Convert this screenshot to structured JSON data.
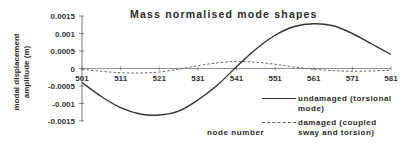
{
  "chart_data": {
    "type": "line",
    "title": "Mass normalised mode shapes",
    "xlabel": "node number",
    "ylabel": "modal displacement amplitude (m)",
    "xlim": [
      501,
      581
    ],
    "ylim": [
      -0.0015,
      0.0015
    ],
    "x_ticks": [
      501,
      511,
      521,
      531,
      541,
      551,
      561,
      571,
      581
    ],
    "y_ticks": [
      0.0015,
      0.001,
      0.0005,
      0,
      -0.0005,
      -0.001,
      -0.0015
    ],
    "y_tick_labels": [
      "0.0015",
      "0.001",
      "0.0005",
      "0",
      "-0.0005",
      "-0.001",
      "-0.0015"
    ],
    "grid": false,
    "legend_position": "lower right (outside plot area)",
    "x": [
      501,
      506,
      511,
      516,
      521,
      526,
      531,
      536,
      541,
      546,
      551,
      556,
      561,
      566,
      571,
      576,
      581
    ],
    "series": [
      {
        "name": "undamaged (torsional mode)",
        "style": "solid",
        "color": "#333333",
        "values": [
          -0.0004,
          -0.0008,
          -0.00112,
          -0.0013,
          -0.00133,
          -0.00122,
          -0.0009,
          -0.00048,
          5e-05,
          0.00055,
          0.00095,
          0.0012,
          0.00128,
          0.00122,
          0.001,
          0.0007,
          0.0004
        ]
      },
      {
        "name": "damaged (coupled sway and torsion)",
        "style": "dashed",
        "color": "#666666",
        "values": [
          -2e-05,
          -8e-05,
          -0.00012,
          -0.00013,
          -0.0001,
          -2e-05,
          8e-05,
          0.00016,
          0.0002,
          0.00018,
          0.00012,
          4e-05,
          -2e-05,
          -6e-05,
          -8e-05,
          -7e-05,
          -5e-05
        ]
      }
    ]
  },
  "labels": {
    "title": "Mass normalised mode shapes",
    "xlabel": "node number",
    "ylabel_line1": "modal displacement",
    "ylabel_line2": "amplitude (m)",
    "legend": [
      "undamaged (torsional mode)",
      "damaged (coupled sway and torsion)"
    ]
  }
}
